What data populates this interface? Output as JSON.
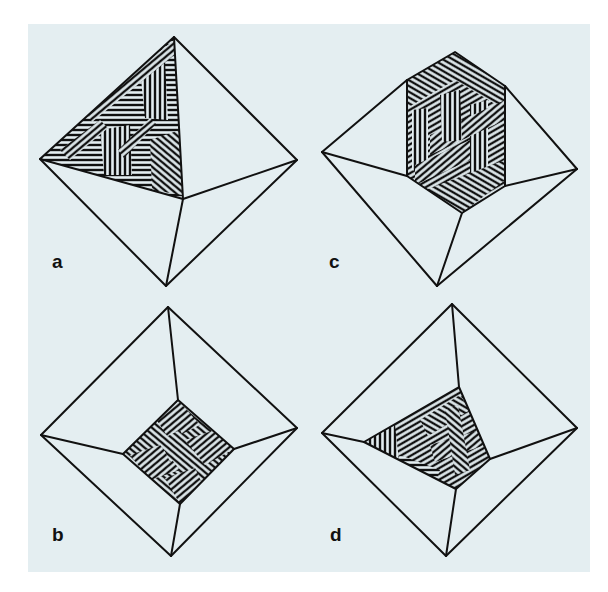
{
  "figure": {
    "background_color": "#e4eef1",
    "line_color": "#111111",
    "panels": [
      {
        "id": "a",
        "label": "a",
        "description": "Octahedron with lamellar texture on the upper-left face"
      },
      {
        "id": "c",
        "label": "c",
        "description": "Octahedron with hexagonal textured patch across upper faces"
      },
      {
        "id": "b",
        "label": "b",
        "description": "Octahedron viewed along apex with textured square at center"
      },
      {
        "id": "d",
        "label": "d",
        "description": "Octahedron viewed along apex with textured triangle at center"
      }
    ]
  }
}
